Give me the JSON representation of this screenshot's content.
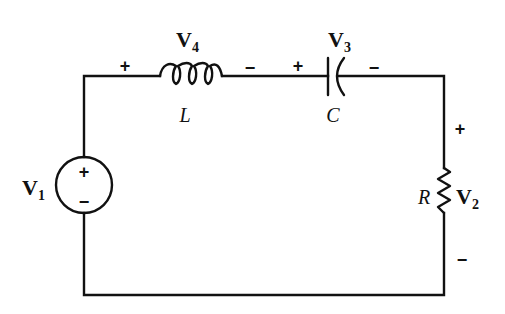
{
  "diagram": {
    "type": "series RLC circuit",
    "components": {
      "source": {
        "label_main": "V",
        "label_sub": "1",
        "plus": "+",
        "minus": "−"
      },
      "inductor": {
        "name": "L",
        "voltage_main": "V",
        "voltage_sub": "4",
        "plus": "+",
        "minus": "−"
      },
      "capacitor": {
        "name": "C",
        "voltage_main": "V",
        "voltage_sub": "3",
        "plus": "+",
        "minus": "−"
      },
      "resistor": {
        "name": "R",
        "voltage_main": "V",
        "voltage_sub": "2",
        "plus": "+",
        "minus": "−"
      }
    },
    "colors": {
      "ink": "#111111",
      "background": "#ffffff"
    }
  }
}
